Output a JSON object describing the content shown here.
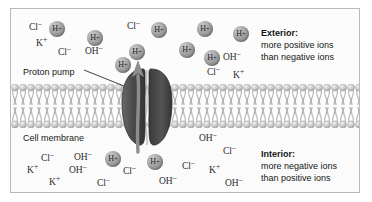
{
  "figure": {
    "labels": {
      "proton_pump": "Proton pump",
      "cell_membrane": "Cell membrane"
    },
    "exterior_note": {
      "heading": "Exterior:",
      "line1": "more positive ions",
      "line2": "than negative ions"
    },
    "interior_note": {
      "heading": "Interior:",
      "line1": "more negative ions",
      "line2": "than positive ions"
    },
    "colors": {
      "ion_sphere": "#8a8a8a",
      "pump_body": "#4a4a4a",
      "membrane_head": "#cfcfcf",
      "border": "#b9b9b9",
      "text": "#1a1a1a"
    },
    "exterior_ions": [
      {
        "label": "Cl⁻",
        "kind": "text",
        "x": 18,
        "y": 14
      },
      {
        "label": "H⁺",
        "kind": "sphere",
        "x": 38,
        "y": 12
      },
      {
        "label": "H⁺",
        "kind": "sphere",
        "x": 76,
        "y": 21
      },
      {
        "label": "Cl⁻",
        "kind": "text",
        "x": 116,
        "y": 13
      },
      {
        "label": "H⁺",
        "kind": "sphere",
        "x": 140,
        "y": 13
      },
      {
        "label": "H⁺",
        "kind": "sphere",
        "x": 186,
        "y": 12
      },
      {
        "label": "H⁺",
        "kind": "sphere",
        "x": 222,
        "y": 17
      },
      {
        "label": "K⁺",
        "kind": "text",
        "x": 25,
        "y": 30
      },
      {
        "label": "Cl⁻",
        "kind": "text",
        "x": 47,
        "y": 39
      },
      {
        "label": "OH⁻",
        "kind": "text",
        "x": 74,
        "y": 38
      },
      {
        "label": "H⁺",
        "kind": "sphere",
        "x": 118,
        "y": 35
      },
      {
        "label": "H⁺",
        "kind": "sphere",
        "x": 168,
        "y": 33
      },
      {
        "label": "H⁺",
        "kind": "sphere",
        "x": 193,
        "y": 41
      },
      {
        "label": "OH⁻",
        "kind": "text",
        "x": 212,
        "y": 44
      },
      {
        "label": "H⁺",
        "kind": "sphere",
        "x": 104,
        "y": 48
      },
      {
        "label": "Cl⁻",
        "kind": "text",
        "x": 196,
        "y": 59
      },
      {
        "label": "K⁺",
        "kind": "text",
        "x": 222,
        "y": 62
      }
    ],
    "interior_ions": [
      {
        "label": "OH⁻",
        "kind": "text",
        "x": 188,
        "y": 125
      },
      {
        "label": "Cl⁻",
        "kind": "text",
        "x": 30,
        "y": 145
      },
      {
        "label": "OH⁻",
        "kind": "text",
        "x": 63,
        "y": 144
      },
      {
        "label": "H⁺",
        "kind": "sphere",
        "x": 94,
        "y": 142
      },
      {
        "label": "H⁺",
        "kind": "sphere",
        "x": 136,
        "y": 145
      },
      {
        "label": "Cl⁻",
        "kind": "text",
        "x": 212,
        "y": 138
      },
      {
        "label": "K⁺",
        "kind": "text",
        "x": 16,
        "y": 157
      },
      {
        "label": "OH⁻",
        "kind": "text",
        "x": 58,
        "y": 157
      },
      {
        "label": "Cl⁻",
        "kind": "text",
        "x": 112,
        "y": 158
      },
      {
        "label": "Cl⁻",
        "kind": "text",
        "x": 171,
        "y": 153
      },
      {
        "label": "K⁺",
        "kind": "text",
        "x": 198,
        "y": 157
      },
      {
        "label": "K⁺",
        "kind": "text",
        "x": 38,
        "y": 169
      },
      {
        "label": "Cl⁻",
        "kind": "text",
        "x": 86,
        "y": 170
      },
      {
        "label": "OH⁻",
        "kind": "text",
        "x": 148,
        "y": 168
      },
      {
        "label": "OH⁻",
        "kind": "text",
        "x": 214,
        "y": 170
      }
    ]
  }
}
